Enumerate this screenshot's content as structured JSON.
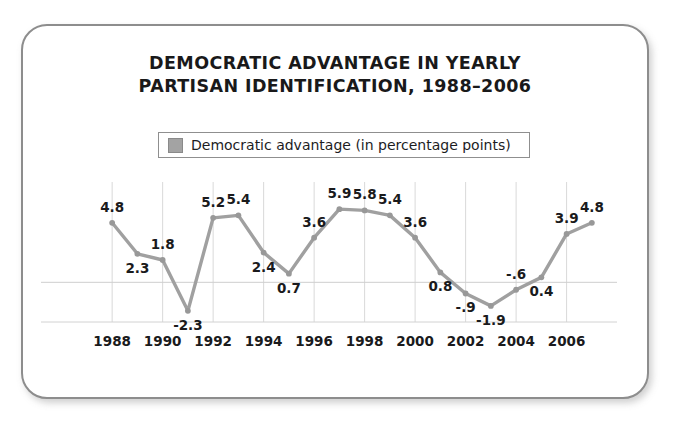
{
  "card": {
    "border_color": "#8d8d8d",
    "background": "#ffffff"
  },
  "chart_data": {
    "type": "line",
    "title": "DEMOCRATIC ADVANTAGE IN YEARLY PARTISAN IDENTIFICATION, 1988–2006",
    "title_lines": [
      "DEMOCRATIC ADVANTAGE IN YEARLY",
      "PARTISAN IDENTIFICATION, 1988–2006"
    ],
    "xlabel": "",
    "ylabel": "",
    "legend": {
      "position": "top-center",
      "entries": [
        {
          "name": "Democratic advantage (in percentage points)",
          "color": "#a3a3a3"
        }
      ]
    },
    "series": [
      {
        "name": "Democratic advantage (in percentage points)",
        "color": "#a0a0a0",
        "values": [
          4.8,
          2.3,
          1.8,
          -2.3,
          5.2,
          5.4,
          2.4,
          0.7,
          3.6,
          5.9,
          5.8,
          5.4,
          3.6,
          0.8,
          -0.9,
          -1.9,
          -0.6,
          0.4,
          3.9,
          4.8
        ]
      }
    ],
    "x": [
      1988,
      1989,
      1990,
      1991,
      1992,
      1993,
      1994,
      1995,
      1996,
      1997,
      1998,
      1999,
      2000,
      2001,
      2002,
      2003,
      2004,
      2005,
      2006,
      2007
    ],
    "point_labels": [
      "4.8",
      "2.3",
      "1.8",
      "-2.3",
      "5.2",
      "5.4",
      "2.4",
      "0.7",
      "3.6",
      "5.9",
      "5.8",
      "5.4",
      "3.6",
      "0.8",
      "-.9",
      "-1.9",
      "-.6",
      "0.4",
      "3.9",
      "4.8"
    ],
    "label_positions": [
      "above",
      "below",
      "above",
      "below",
      "above",
      "above",
      "below",
      "below",
      "above",
      "above",
      "above",
      "above",
      "above",
      "below",
      "below",
      "below",
      "above",
      "below",
      "above",
      "above"
    ],
    "xtick_labels": [
      "1988",
      "1990",
      "1992",
      "1994",
      "1996",
      "1998",
      "2000",
      "2002",
      "2004",
      "2006"
    ],
    "xtick_values": [
      1988,
      1990,
      1992,
      1994,
      1996,
      1998,
      2000,
      2002,
      2004,
      2006
    ],
    "ylim": [
      -3.2,
      6.8
    ],
    "xlim": [
      1987.4,
      2007.6
    ],
    "grid": "vertical-light",
    "zero_line": true,
    "ytick_labels": []
  }
}
